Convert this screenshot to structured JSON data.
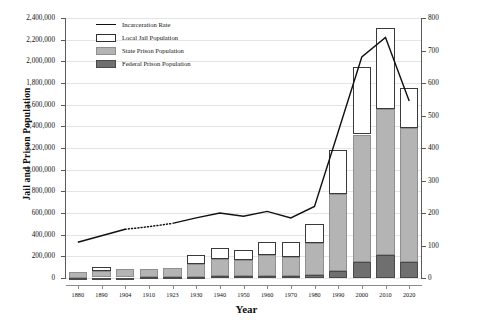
{
  "chart_data": {
    "type": "bar",
    "title": "",
    "xlabel": "Year",
    "ylabel": "Jail and Prison Population",
    "ylabel_right": "Incarceration Rate per 100,000 Persons",
    "grid": true,
    "legend_position": "top-left",
    "ylim": [
      0,
      2400000
    ],
    "ylim_right": [
      0,
      800
    ],
    "yticks": [
      "0",
      "200,000",
      "400,000",
      "600,000",
      "800,000",
      "1,000,000",
      "1,200,000",
      "1,400,000",
      "1,600,000",
      "1,800,000",
      "2,000,000",
      "2,200,000",
      "2,400,000"
    ],
    "ytick_values": [
      0,
      200000,
      400000,
      600000,
      800000,
      1000000,
      1200000,
      1400000,
      1600000,
      1800000,
      2000000,
      2200000,
      2400000
    ],
    "yticks_right": [
      "0",
      "100",
      "200",
      "300",
      "400",
      "500",
      "600",
      "700",
      "800"
    ],
    "ytick_values_right": [
      0,
      100,
      200,
      300,
      400,
      500,
      600,
      700,
      800
    ],
    "categories": [
      "1880",
      "1890",
      "1904",
      "1910",
      "1923",
      "1930",
      "1940",
      "1950",
      "1960",
      "1970",
      "1980",
      "1990",
      "2000",
      "2010",
      "2020"
    ],
    "series": [
      {
        "name": "Federal Prison Population",
        "type": "bar-segment",
        "color": "#6f6f6f",
        "values": [
          3000,
          4000,
          5000,
          6000,
          8000,
          13000,
          20000,
          18000,
          23000,
          21000,
          24000,
          65000,
          145000,
          210000,
          152000
        ]
      },
      {
        "name": "State Prison Population",
        "type": "bar-segment",
        "color": "#b4b4b4",
        "values": [
          55000,
          63000,
          74000,
          78000,
          82000,
          117000,
          153000,
          148000,
          189000,
          175000,
          295000,
          708000,
          1180000,
          1350000,
          1230000
        ]
      },
      {
        "name": "Local Jail Population",
        "type": "bar-segment",
        "color": "#ffffff",
        "values": [
          0,
          38000,
          0,
          0,
          0,
          83000,
          100000,
          90000,
          120000,
          135000,
          182000,
          405000,
          620000,
          750000,
          368000
        ]
      },
      {
        "name": "Incarceration Rate",
        "type": "line",
        "color": "#111111",
        "axis": "right",
        "values": [
          110,
          130,
          150,
          158,
          168,
          185,
          200,
          190,
          205,
          185,
          220,
          450,
          680,
          740,
          545
        ],
        "dashed_range": [
          "1904",
          "1923"
        ]
      }
    ]
  },
  "legend": {
    "items": [
      {
        "label": "Incarceration Rate",
        "key": "line"
      },
      {
        "label": "Local Jail Population",
        "key": "swatch-white"
      },
      {
        "label": "State Prison Population",
        "key": "swatch-gray"
      },
      {
        "label": "Federal Prison Population",
        "key": "swatch-darkgray"
      }
    ]
  }
}
